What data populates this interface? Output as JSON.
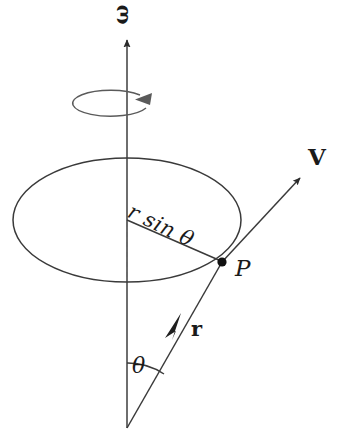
{
  "figure": {
    "background_color": "#ffffff",
    "stroke_color": "#3a3a3a",
    "ink_color": "#1a1a1a",
    "labels": {
      "omega": "ω",
      "r_sin_theta": "r sin θ",
      "point_P": "P",
      "velocity_V": "V",
      "radius_r": "r",
      "angle_theta": "θ"
    },
    "elements": {
      "spin_axis": "vertical arrow pointing up, labelled omega",
      "rotation_indicator": "small open ellipse around the axis with arrowhead showing sense of rotation",
      "circle_of_rotation": "large ellipse (circle seen in perspective) traced by point P",
      "radius_line": "line from axis centre to P, length r sin theta",
      "dashed_drop_line": "vertical dashed segment from ellipse centre to ellipse near edge",
      "position_vector": "arrow from origin apex up-right to P, labelled r",
      "velocity_vector": "arrow from P up-right tangent to the circle, labelled V",
      "angle_arc": "arc between the spin axis and the position vector, labelled theta",
      "point_marker": "filled dot at P on the ellipse"
    },
    "geometry": {
      "axis_x": 127,
      "axis_top_y": 38,
      "axis_bottom_y": 428,
      "ellipse_center": [
        127,
        220
      ],
      "ellipse_rx": 114,
      "ellipse_ry": 62,
      "point_P": [
        222,
        262
      ],
      "apex_origin": [
        127,
        428
      ],
      "rotation_indicator_center": [
        113,
        104
      ],
      "rotation_indicator_rx": 38,
      "rotation_indicator_ry": 13
    }
  }
}
